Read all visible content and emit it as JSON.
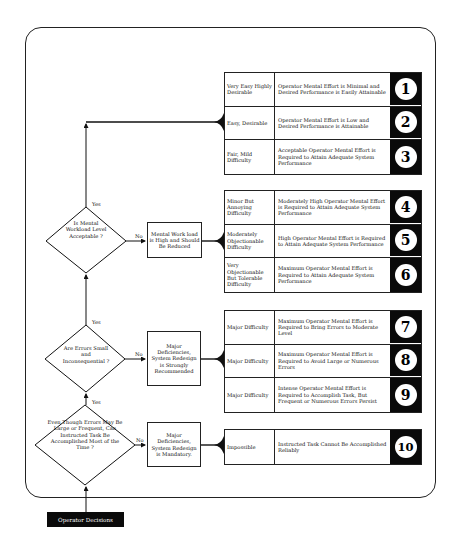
{
  "footer": {
    "start_label": "Operator Decisions"
  },
  "decisions": [
    {
      "id": "workload",
      "question": "Is Mental Workload Level Acceptable ?",
      "yes": "Yes",
      "no": "No",
      "outcome": "Mental Work load is High and Should Be Reduced"
    },
    {
      "id": "errors",
      "question": "Are Errors Small and Inconsequential ?",
      "yes": "Yes",
      "no": "No",
      "outcome": "Major Deficiencies, System Redesign is Strongly Recommended"
    },
    {
      "id": "accomplish",
      "question": "Even Though Errors May Be Large or Frequent, Can Instructed Task Be Accomplished Most of the Time ?",
      "yes": "Yes",
      "no": "No",
      "outcome": "Major Deficiencies, System Redesign is Mandatory."
    }
  ],
  "ratings": [
    {
      "difficulty": "Very Easy Highly Desirable",
      "demand": "Operator Mental Effort is Minimal and Desired Performance is Easily Attainable",
      "rating": "1"
    },
    {
      "difficulty": "Easy, Desirable",
      "demand": "Operator Mental Effort is Low and Desired Performance is Attainable",
      "rating": "2"
    },
    {
      "difficulty": "Fair, Mild Difficulty",
      "demand": "Acceptable Operator Mental Effort is Required to Attain Adequate System Performance",
      "rating": "3"
    },
    {
      "difficulty": "Minor But Annoying Difficulty",
      "demand": "Moderately High Operator Mental Effort is Required to Attain Adequate System Performance",
      "rating": "4"
    },
    {
      "difficulty": "Moderately Objectionable Difficulty",
      "demand": "High Operator Mental Effort is Required to Attain Adequate System Performance",
      "rating": "5"
    },
    {
      "difficulty": "Very Objectionable But Tolerable Difficulty",
      "demand": "Maximum Operator Mental Effort is Required to Attain Adequate System Performance",
      "rating": "6"
    },
    {
      "difficulty": "Major Difficulty",
      "demand": "Maximum Operator Mental Effort is Required to Bring Errors to Moderate Level",
      "rating": "7"
    },
    {
      "difficulty": "Major Difficulty",
      "demand": "Maximum Operator Mental Effort is Required to Avoid Large or Numerous Errors",
      "rating": "8"
    },
    {
      "difficulty": "Major Difficulty",
      "demand": "Intense Operator Mental Effort is Required to Accomplish Task, But Frequent or Numerous Errors Persist",
      "rating": "9"
    },
    {
      "difficulty": "Impossible",
      "demand": "Instructed Task Cannot Be Accomplished Reliably",
      "rating": "10"
    }
  ],
  "colors": {
    "ink": "#111111",
    "rating_bg": "#0a0a0a",
    "paper": "#ffffff"
  }
}
